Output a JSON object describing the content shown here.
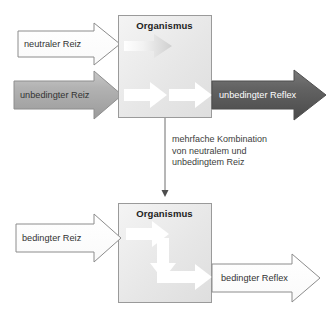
{
  "diagram": {
    "title_hidden": "Klassische Konditionierung",
    "top": {
      "box_label": "Organismus",
      "inputs": [
        {
          "label": "neutraler Reiz",
          "style": "outline-white"
        },
        {
          "label": "unbedingter Reiz",
          "style": "filled-gray"
        }
      ],
      "output": {
        "label": "unbedingter Reflex",
        "style": "filled-darkgray"
      },
      "inner_arrows": [
        {
          "name": "faded-neutral-path",
          "style": "faded"
        },
        {
          "name": "unconditioned-path-1",
          "style": "white"
        },
        {
          "name": "unconditioned-path-2",
          "style": "white"
        }
      ]
    },
    "connector": {
      "note": "mehrfache Kombination\nvon neutralem und\nunbedingtem Reiz"
    },
    "bottom": {
      "box_label": "Organismus",
      "inputs": [
        {
          "label": "bedingter Reiz",
          "style": "outline-white"
        }
      ],
      "output": {
        "label": "bedingter Reflex",
        "style": "outline-white"
      },
      "inner_arrows": [
        {
          "name": "conditioned-path-right",
          "style": "white"
        },
        {
          "name": "conditioned-path-down",
          "style": "white"
        },
        {
          "name": "conditioned-path-right-2",
          "style": "white"
        }
      ]
    }
  },
  "colors": {
    "box_border": "#9a9a9a",
    "box_fill": "#e8e8e8",
    "arrow_outline": "#8c8c8c",
    "arrow_gray": "#a6a6a6",
    "arrow_darkgray": "#5a5a5a",
    "text": "#333333",
    "connector_line": "#6f6f6f"
  }
}
